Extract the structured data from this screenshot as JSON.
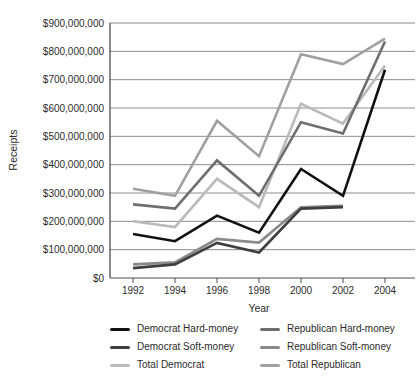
{
  "figure": {
    "y_axis_title": "Receipts",
    "x_axis_title": "Year",
    "y_tick_labels": [
      "$0",
      "$100,000,000",
      "$200,000,000",
      "$300,000,000",
      "$400,000,000",
      "$500,000,000",
      "$600,000,000",
      "$700,000,000",
      "$800,000,000",
      "$900,000,000"
    ],
    "x_tick_labels": [
      "1992",
      "1994",
      "1996",
      "1998",
      "2000",
      "2002",
      "2004"
    ]
  },
  "chart_data": {
    "type": "line",
    "title": "",
    "xlabel": "Year",
    "ylabel": "Receipts",
    "x": [
      1992,
      1994,
      1996,
      1998,
      2000,
      2002,
      2004
    ],
    "ylim_usd": [
      0,
      900000000
    ],
    "y_tick_step_usd": 100000000,
    "grid": true,
    "legend_position": "bottom",
    "value_unit": "USD millions (read from gridlines)",
    "note": "Soft-money series end in 2002 (no 2004 data point)",
    "series": [
      {
        "name": "Democrat Hard-money",
        "color": "#111111",
        "values_usd_millions": [
          155,
          130,
          220,
          160,
          385,
          290,
          735
        ]
      },
      {
        "name": "Democrat Soft-money",
        "color": "#3f3f3f",
        "values_usd_millions": [
          35,
          48,
          124,
          90,
          245,
          250,
          null
        ]
      },
      {
        "name": "Total Democrat",
        "color": "#bababa",
        "values_usd_millions": [
          200,
          180,
          350,
          250,
          615,
          545,
          750
        ]
      },
      {
        "name": "Republican Hard-money",
        "color": "#6e6e6e",
        "values_usd_millions": [
          260,
          245,
          415,
          290,
          550,
          510,
          835
        ]
      },
      {
        "name": "Republican Soft-money",
        "color": "#8a8a8a",
        "values_usd_millions": [
          48,
          55,
          138,
          125,
          250,
          255,
          null
        ]
      },
      {
        "name": "Total Republican",
        "color": "#a0a0a0",
        "values_usd_millions": [
          315,
          290,
          555,
          430,
          790,
          755,
          845
        ]
      }
    ]
  },
  "layout_hint": {
    "legend_columns": [
      "Democrat Hard-money, Democrat Soft-money, Total Democrat",
      "Republican Hard-money, Republican Soft-money, Total Republican"
    ]
  }
}
